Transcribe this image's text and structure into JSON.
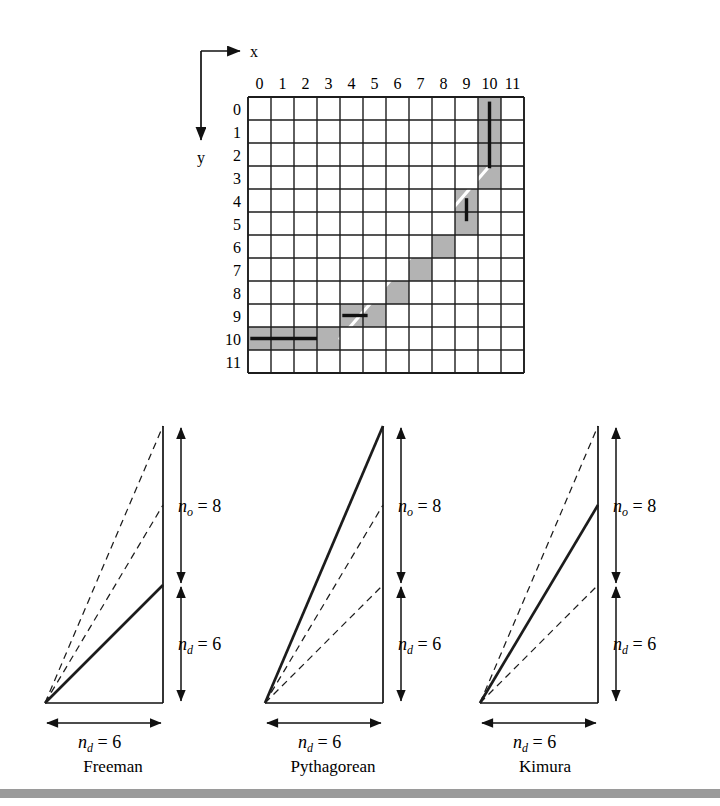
{
  "figure": {
    "grid": {
      "axis_labels": {
        "x": "x",
        "y": "y"
      },
      "columns": [
        "0",
        "1",
        "2",
        "3",
        "4",
        "5",
        "6",
        "7",
        "8",
        "9",
        "10",
        "11"
      ],
      "rows": [
        "0",
        "1",
        "2",
        "3",
        "4",
        "5",
        "6",
        "7",
        "8",
        "9",
        "10",
        "11"
      ],
      "n_cols": 12,
      "n_rows": 12,
      "cell_px": 23,
      "origin_px": {
        "x": 248,
        "y": 97
      },
      "shaded_color": "#b3b3b3",
      "line_color": "#ffffff",
      "tick_color": "#111111",
      "shaded_cells": [
        {
          "col": 0,
          "row": 10
        },
        {
          "col": 1,
          "row": 10
        },
        {
          "col": 2,
          "row": 10
        },
        {
          "col": 3,
          "row": 10
        },
        {
          "col": 4,
          "row": 9
        },
        {
          "col": 5,
          "row": 9
        },
        {
          "col": 6,
          "row": 8
        },
        {
          "col": 7,
          "row": 7
        },
        {
          "col": 8,
          "row": 6
        },
        {
          "col": 9,
          "row": 5
        },
        {
          "col": 9,
          "row": 4
        },
        {
          "col": 10,
          "row": 3
        },
        {
          "col": 10,
          "row": 2
        },
        {
          "col": 10,
          "row": 1
        },
        {
          "col": 10,
          "row": 0
        }
      ],
      "ideal_line": {
        "from": {
          "col": 4,
          "row": 10.5
        },
        "to": {
          "col": 10.5,
          "row": 3
        }
      },
      "deviation_ticks": [
        {
          "orientation": "horizontal",
          "col_from": 0.1,
          "col_to": 3.0,
          "row": 10.5
        },
        {
          "orientation": "horizontal",
          "col_from": 4.1,
          "col_to": 5.2,
          "row": 9.5
        },
        {
          "orientation": "vertical",
          "col": 9.5,
          "row_from": 4.4,
          "row_to": 5.4
        },
        {
          "orientation": "vertical",
          "col": 10.5,
          "row_from": 0.2,
          "row_to": 3.1
        }
      ]
    },
    "diagrams": [
      {
        "id": "freeman",
        "caption": "Freeman",
        "emphasized_line": "nd_junction",
        "labels": {
          "vertical_top": {
            "var": "n",
            "sub": "o",
            "eq": "= 8",
            "text": "n_o = 8"
          },
          "vertical_bottom": {
            "var": "n",
            "sub": "d",
            "eq": "= 6",
            "text": "n_d = 6"
          },
          "horizontal": {
            "var": "n",
            "sub": "d",
            "eq": "= 6",
            "text": "n_d = 6"
          }
        }
      },
      {
        "id": "pythagorean",
        "caption": "Pythagorean",
        "emphasized_line": "apex",
        "labels": {
          "vertical_top": {
            "var": "n",
            "sub": "o",
            "eq": "= 8",
            "text": "n_o = 8"
          },
          "vertical_bottom": {
            "var": "n",
            "sub": "d",
            "eq": "= 6",
            "text": "n_d = 6"
          },
          "horizontal": {
            "var": "n",
            "sub": "d",
            "eq": "= 6",
            "text": "n_d = 6"
          }
        }
      },
      {
        "id": "kimura",
        "caption": "Kimura",
        "emphasized_line": "middle",
        "labels": {
          "vertical_top": {
            "var": "n",
            "sub": "o",
            "eq": "= 8",
            "text": "n_o = 8"
          },
          "vertical_bottom": {
            "var": "n",
            "sub": "d",
            "eq": "= 6",
            "text": "n_d = 6"
          },
          "horizontal": {
            "var": "n",
            "sub": "d",
            "eq": "= 6",
            "text": "n_d = 6"
          }
        }
      }
    ],
    "footer_bar_color": "#9a9a9a"
  }
}
